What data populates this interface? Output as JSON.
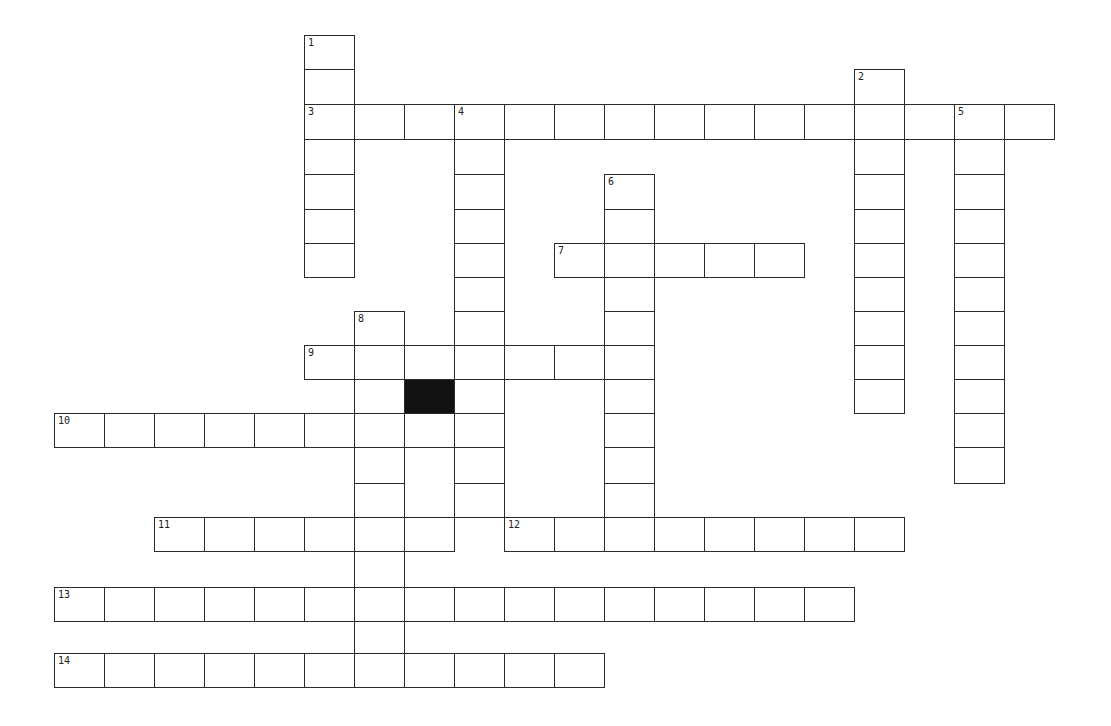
{
  "puzzle": {
    "type": "crossword",
    "grid_origin": {
      "x": 55,
      "y": 36
    },
    "cell_width": 50,
    "row_tops": [
      36,
      70,
      105,
      140,
      175,
      210,
      244,
      278,
      312,
      346,
      380,
      414,
      448,
      484,
      518,
      552,
      588,
      622,
      654,
      688
    ],
    "colors": {
      "border": "#2a2a2a",
      "cell": "#ffffff",
      "block": "#111111"
    },
    "entries": [
      {
        "number": "1",
        "direction": "down",
        "row": 0,
        "col": 5,
        "length": 7
      },
      {
        "number": "2",
        "direction": "down",
        "row": 1,
        "col": 16,
        "length": 10
      },
      {
        "number": "3",
        "direction": "across",
        "row": 2,
        "col": 5,
        "length": 15
      },
      {
        "number": "4",
        "direction": "down",
        "row": 2,
        "col": 8,
        "length": 12
      },
      {
        "number": "5",
        "direction": "down",
        "row": 2,
        "col": 18,
        "length": 11
      },
      {
        "number": "6",
        "direction": "down",
        "row": 4,
        "col": 11,
        "length": 11
      },
      {
        "number": "7",
        "direction": "across",
        "row": 6,
        "col": 10,
        "length": 5
      },
      {
        "number": "8",
        "direction": "down",
        "row": 8,
        "col": 6,
        "length": 11
      },
      {
        "number": "9",
        "direction": "across",
        "row": 9,
        "col": 5,
        "length": 7
      },
      {
        "number": "10",
        "direction": "across",
        "row": 11,
        "col": 0,
        "length": 9
      },
      {
        "number": "11",
        "direction": "across",
        "row": 14,
        "col": 2,
        "length": 6
      },
      {
        "number": "12",
        "direction": "across",
        "row": 14,
        "col": 9,
        "length": 8
      },
      {
        "number": "13",
        "direction": "across",
        "row": 16,
        "col": 0,
        "length": 16
      },
      {
        "number": "14",
        "direction": "across",
        "row": 18,
        "col": 0,
        "length": 11
      }
    ],
    "blocks": [
      {
        "row": 10,
        "col": 7
      }
    ]
  }
}
